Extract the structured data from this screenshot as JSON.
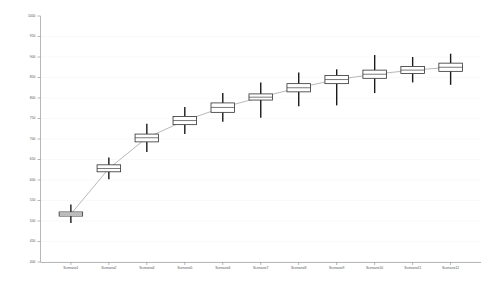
{
  "chart_data": {
    "type": "box",
    "title": "",
    "subtitle": "",
    "xlabel": "",
    "ylabel": "",
    "ylim": [
      400,
      1000
    ],
    "ytick_step": 50,
    "grid": true,
    "legend": null,
    "yticks": [
      "1000",
      "950",
      "900",
      "850",
      "800",
      "750",
      "700",
      "650",
      "600",
      "550",
      "500",
      "450",
      "400"
    ],
    "ytick_values": [
      1000,
      950,
      900,
      850,
      800,
      750,
      700,
      650,
      600,
      550,
      500,
      450,
      400
    ],
    "categories": [
      "Scenario1",
      "Scenario2",
      "Scenario4",
      "Scenario5",
      "Scenario6",
      "Scenario7",
      "Scenario8",
      "Scenario9",
      "Scenario10",
      "Scenario11",
      "Scenario12"
    ],
    "xtick_labels": [
      "Scenario1",
      "Scenario2",
      "Scenario4",
      "Scenario5",
      "Scenario6",
      "Scenario7",
      "Scenario8",
      "Scenario9",
      "Scenario10",
      "Scenario11",
      "Scenario12"
    ],
    "boxes": [
      {
        "category": "Scenario1",
        "whisker_low": 495,
        "q1": 512,
        "median": 517,
        "q3": 522,
        "whisker_high": 540
      },
      {
        "category": "Scenario2",
        "whisker_low": 602,
        "q1": 620,
        "median": 628,
        "q3": 637,
        "whisker_high": 655
      },
      {
        "category": "Scenario4",
        "whisker_low": 668,
        "q1": 693,
        "median": 703,
        "q3": 712,
        "whisker_high": 737
      },
      {
        "category": "Scenario5",
        "whisker_low": 712,
        "q1": 735,
        "median": 745,
        "q3": 755,
        "whisker_high": 778
      },
      {
        "category": "Scenario6",
        "whisker_low": 742,
        "q1": 765,
        "median": 777,
        "q3": 788,
        "whisker_high": 812
      },
      {
        "category": "Scenario7",
        "whisker_low": 752,
        "q1": 795,
        "median": 802,
        "q3": 810,
        "whisker_high": 838
      },
      {
        "category": "Scenario8",
        "whisker_low": 780,
        "q1": 815,
        "median": 825,
        "q3": 835,
        "whisker_high": 862
      },
      {
        "category": "Scenario9",
        "whisker_low": 782,
        "q1": 835,
        "median": 845,
        "q3": 855,
        "whisker_high": 870
      },
      {
        "category": "Scenario10",
        "whisker_low": 812,
        "q1": 848,
        "median": 858,
        "q3": 868,
        "whisker_high": 905
      },
      {
        "category": "Scenario11",
        "whisker_low": 838,
        "q1": 860,
        "median": 868,
        "q3": 877,
        "whisker_high": 900
      },
      {
        "category": "Scenario12",
        "whisker_low": 832,
        "q1": 865,
        "median": 875,
        "q3": 885,
        "whisker_high": 908
      }
    ],
    "trend_series": {
      "name": "median-trend",
      "values": [
        517,
        628,
        703,
        745,
        777,
        802,
        825,
        845,
        858,
        868,
        875
      ]
    },
    "colors": {
      "box_fill": "#ffffff",
      "box_stroke": "#303030",
      "median": "#404040",
      "whisker": "#1a1a1a",
      "trend": "#9a9a9a",
      "axis": "#888888",
      "grid": "#f2f2f2",
      "tick_text": "#555555",
      "background": "#ffffff"
    }
  }
}
